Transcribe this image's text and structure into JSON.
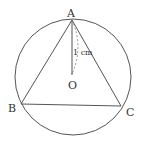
{
  "diagram": {
    "type": "geometry",
    "colors": {
      "stroke": "#555555",
      "text": "#333333",
      "background": "#ffffff"
    },
    "circle": {
      "center": "O",
      "cx": 73,
      "cy": 77,
      "r": 58
    },
    "points": [
      {
        "id": "A",
        "label": "A",
        "x": 72,
        "y": 20
      },
      {
        "id": "B",
        "label": "B",
        "x": 21,
        "y": 104
      },
      {
        "id": "C",
        "label": "C",
        "x": 121,
        "y": 106
      },
      {
        "id": "O",
        "label": "O",
        "x": 72,
        "y": 74
      }
    ],
    "segments": [
      "AB",
      "BC",
      "CA",
      "AO"
    ],
    "dashed_arc": "from A to O (dimension marker)",
    "measurement": {
      "segment": "AO",
      "label": "1 cm"
    }
  }
}
